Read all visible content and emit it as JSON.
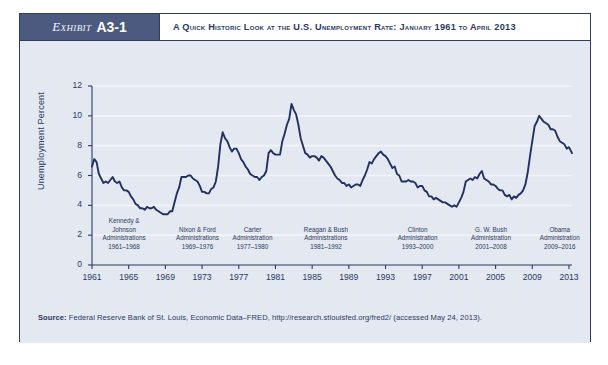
{
  "header": {
    "exhibit_word": "Exhibit",
    "exhibit_number": "A3-1",
    "title": "A Quick Historic Look at the U.S. Unemployment Rate: January 1961 to April 2013"
  },
  "source": {
    "label": "Source:",
    "text": " Federal Reserve Bank of St. Louis, Economic Data–FRED, http://research.stlouisfed.org/fred2/ (accessed May 24, 2013)."
  },
  "colors": {
    "frame": "#2e3b62",
    "exhibit_box": "#4c5a80",
    "plot_background": "#e3e8f1",
    "line": "#23315e",
    "text": "#2b3a63",
    "gridline": "#f2f4f9"
  },
  "annotations": [
    {
      "lines": [
        "Kennedy &",
        "Johnson",
        "Administrations",
        "1961–1968"
      ],
      "center_year": 1964.5
    },
    {
      "lines": [
        "Nixon & Ford",
        "Administrations",
        "1969–1976"
      ],
      "center_year": 1972.5
    },
    {
      "lines": [
        "Carter",
        "Administration",
        "1977–1980"
      ],
      "center_year": 1978.5
    },
    {
      "lines": [
        "Reagan & Bush",
        "Administrations",
        "1981–1992"
      ],
      "center_year": 1986.5
    },
    {
      "lines": [
        "Clinton",
        "Administration",
        "1993–2000"
      ],
      "center_year": 1996.5
    },
    {
      "lines": [
        "G. W. Bush",
        "Administration",
        "2001–2008"
      ],
      "center_year": 2004.5
    },
    {
      "lines": [
        "Obama",
        "Administration",
        "2009–2016"
      ],
      "center_year": 2012.0
    }
  ],
  "chart_data": {
    "type": "line",
    "title": "A Quick Historic Look at the U.S. Unemployment Rate: January 1961 to April 2013",
    "xlabel": "",
    "ylabel": "Unemployment Percent",
    "xlim": [
      1961,
      2013.33
    ],
    "ylim": [
      0,
      12
    ],
    "yticks": [
      0,
      2,
      4,
      6,
      8,
      10,
      12
    ],
    "xticks": [
      1961,
      1965,
      1969,
      1973,
      1977,
      1981,
      1985,
      1989,
      1993,
      1997,
      2001,
      2005,
      2009,
      2013
    ],
    "grid": "horizontal",
    "legend": "none",
    "series_name": "U.S. Unemployment Rate",
    "x": [
      1961.0,
      1961.25,
      1961.5,
      1961.75,
      1962.0,
      1962.25,
      1962.5,
      1962.75,
      1963.0,
      1963.25,
      1963.5,
      1963.75,
      1964.0,
      1964.25,
      1964.5,
      1964.75,
      1965.0,
      1965.25,
      1965.5,
      1965.75,
      1966.0,
      1966.25,
      1966.5,
      1966.75,
      1967.0,
      1967.25,
      1967.5,
      1967.75,
      1968.0,
      1968.25,
      1968.5,
      1968.75,
      1969.0,
      1969.25,
      1969.5,
      1969.75,
      1970.0,
      1970.25,
      1970.5,
      1970.75,
      1971.0,
      1971.25,
      1971.5,
      1971.75,
      1972.0,
      1972.25,
      1972.5,
      1972.75,
      1973.0,
      1973.25,
      1973.5,
      1973.75,
      1974.0,
      1974.25,
      1974.5,
      1974.75,
      1975.0,
      1975.25,
      1975.5,
      1975.75,
      1976.0,
      1976.25,
      1976.5,
      1976.75,
      1977.0,
      1977.25,
      1977.5,
      1977.75,
      1978.0,
      1978.25,
      1978.5,
      1978.75,
      1979.0,
      1979.25,
      1979.5,
      1979.75,
      1980.0,
      1980.25,
      1980.5,
      1980.75,
      1981.0,
      1981.25,
      1981.5,
      1981.75,
      1982.0,
      1982.25,
      1982.5,
      1982.75,
      1983.0,
      1983.25,
      1983.5,
      1983.75,
      1984.0,
      1984.25,
      1984.5,
      1984.75,
      1985.0,
      1985.25,
      1985.5,
      1985.75,
      1986.0,
      1986.25,
      1986.5,
      1986.75,
      1987.0,
      1987.25,
      1987.5,
      1987.75,
      1988.0,
      1988.25,
      1988.5,
      1988.75,
      1989.0,
      1989.25,
      1989.5,
      1989.75,
      1990.0,
      1990.25,
      1990.5,
      1990.75,
      1991.0,
      1991.25,
      1991.5,
      1991.75,
      1992.0,
      1992.25,
      1992.5,
      1992.75,
      1993.0,
      1993.25,
      1993.5,
      1993.75,
      1994.0,
      1994.25,
      1994.5,
      1994.75,
      1995.0,
      1995.25,
      1995.5,
      1995.75,
      1996.0,
      1996.25,
      1996.5,
      1996.75,
      1997.0,
      1997.25,
      1997.5,
      1997.75,
      1998.0,
      1998.25,
      1998.5,
      1998.75,
      1999.0,
      1999.25,
      1999.5,
      1999.75,
      2000.0,
      2000.25,
      2000.5,
      2000.75,
      2001.0,
      2001.25,
      2001.5,
      2001.75,
      2002.0,
      2002.25,
      2002.5,
      2002.75,
      2003.0,
      2003.25,
      2003.5,
      2003.75,
      2004.0,
      2004.25,
      2004.5,
      2004.75,
      2005.0,
      2005.25,
      2005.5,
      2005.75,
      2006.0,
      2006.25,
      2006.5,
      2006.75,
      2007.0,
      2007.25,
      2007.5,
      2007.75,
      2008.0,
      2008.25,
      2008.5,
      2008.75,
      2009.0,
      2009.25,
      2009.5,
      2009.75,
      2010.0,
      2010.25,
      2010.5,
      2010.75,
      2011.0,
      2011.25,
      2011.5,
      2011.75,
      2012.0,
      2012.25,
      2012.5,
      2012.75,
      2013.0,
      2013.33
    ],
    "y": [
      6.6,
      7.1,
      6.9,
      6.1,
      5.8,
      5.5,
      5.6,
      5.5,
      5.7,
      5.9,
      5.6,
      5.5,
      5.6,
      5.2,
      5.0,
      5.0,
      4.9,
      4.6,
      4.4,
      4.1,
      4.0,
      3.8,
      3.8,
      3.7,
      3.9,
      3.8,
      3.8,
      3.9,
      3.7,
      3.6,
      3.5,
      3.4,
      3.4,
      3.4,
      3.6,
      3.6,
      4.2,
      4.8,
      5.2,
      5.9,
      5.9,
      5.9,
      6.0,
      6.0,
      5.8,
      5.7,
      5.6,
      5.3,
      4.9,
      4.9,
      4.8,
      4.8,
      5.1,
      5.2,
      5.6,
      6.6,
      8.1,
      8.9,
      8.5,
      8.3,
      7.9,
      7.6,
      7.8,
      7.8,
      7.5,
      7.1,
      6.9,
      6.6,
      6.4,
      6.1,
      6.0,
      5.9,
      5.9,
      5.7,
      5.9,
      6.0,
      6.3,
      7.5,
      7.7,
      7.5,
      7.4,
      7.4,
      7.4,
      8.3,
      8.8,
      9.4,
      9.8,
      10.8,
      10.4,
      10.1,
      9.4,
      8.5,
      8.0,
      7.5,
      7.4,
      7.2,
      7.3,
      7.3,
      7.2,
      7.0,
      7.3,
      7.2,
      7.0,
      6.8,
      6.6,
      6.3,
      6.0,
      5.8,
      5.7,
      5.5,
      5.5,
      5.3,
      5.4,
      5.2,
      5.3,
      5.4,
      5.4,
      5.3,
      5.7,
      6.0,
      6.4,
      6.9,
      6.8,
      7.1,
      7.3,
      7.5,
      7.6,
      7.4,
      7.3,
      7.1,
      6.8,
      6.5,
      6.6,
      6.1,
      6.0,
      5.6,
      5.6,
      5.6,
      5.7,
      5.6,
      5.6,
      5.5,
      5.2,
      5.3,
      5.3,
      5.0,
      4.9,
      4.6,
      4.6,
      4.4,
      4.5,
      4.4,
      4.3,
      4.2,
      4.2,
      4.1,
      4.0,
      3.9,
      4.0,
      3.9,
      4.2,
      4.5,
      4.9,
      5.6,
      5.7,
      5.8,
      5.7,
      5.9,
      5.8,
      6.1,
      6.3,
      5.8,
      5.7,
      5.6,
      5.4,
      5.4,
      5.3,
      5.1,
      5.0,
      5.0,
      4.7,
      4.6,
      4.7,
      4.4,
      4.6,
      4.5,
      4.7,
      4.8,
      5.0,
      5.4,
      6.2,
      7.3,
      8.3,
      9.3,
      9.6,
      10.0,
      9.8,
      9.6,
      9.5,
      9.4,
      9.1,
      9.1,
      9.0,
      8.6,
      8.3,
      8.2,
      8.1,
      7.8,
      7.9,
      7.5
    ]
  }
}
